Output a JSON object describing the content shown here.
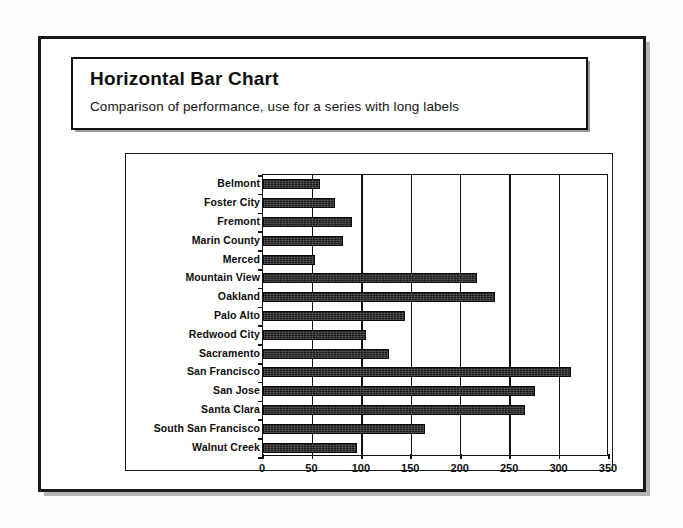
{
  "header": {
    "title": "Horizontal Bar Chart",
    "subtitle": "Comparison of performance, use for a series with long labels"
  },
  "chart_data": {
    "type": "bar",
    "orientation": "horizontal",
    "title": "Horizontal Bar Chart",
    "subtitle": "Comparison of performance, use for a series with long labels",
    "xlabel": "",
    "ylabel": "",
    "xlim": [
      0,
      350
    ],
    "xticks": [
      0,
      50,
      100,
      150,
      200,
      250,
      300,
      350
    ],
    "xtick_labels": [
      "0",
      "50",
      "100",
      "150",
      "200",
      "250",
      "300",
      "350"
    ],
    "grid": "vertical",
    "legend": "none",
    "bar_color": "#1b1b1b",
    "categories": [
      "Belmont",
      "Foster City",
      "Fremont",
      "Marin County",
      "Merced",
      "Mountain View",
      "Oakland",
      "Palo Alto",
      "Redwood City",
      "Sacramento",
      "San Francisco",
      "San Jose",
      "Santa Clara",
      "South San Francisco",
      "Walnut Creek"
    ],
    "values": [
      58,
      73,
      90,
      81,
      53,
      216,
      235,
      144,
      104,
      127,
      312,
      275,
      265,
      164,
      95
    ]
  }
}
